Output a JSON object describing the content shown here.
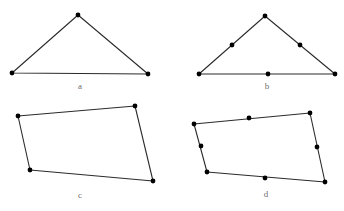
{
  "figure": {
    "width": 344,
    "height": 211,
    "background_color": "#ffffff",
    "line_color": "#2b2b2b",
    "vertex_color": "#000000",
    "label_color": "#6f6f6f",
    "line_width": 1.1,
    "vertex_radius": 2.4
  },
  "panels": [
    {
      "id": "a",
      "label": "a",
      "shape_type": "triangle",
      "label_position": {
        "x": 80,
        "y": 87
      },
      "vertices": [
        {
          "name": "left-base-vertex",
          "x": 12,
          "y": 73
        },
        {
          "name": "apex-vertex",
          "x": 78,
          "y": 15
        },
        {
          "name": "right-base-vertex",
          "x": 148,
          "y": 74
        }
      ],
      "edge_midpoints": []
    },
    {
      "id": "b",
      "label": "b",
      "shape_type": "triangle",
      "label_position": {
        "x": 267,
        "y": 87
      },
      "vertices": [
        {
          "name": "left-base-vertex",
          "x": 199,
          "y": 74
        },
        {
          "name": "apex-vertex",
          "x": 265,
          "y": 16
        },
        {
          "name": "right-base-vertex",
          "x": 335,
          "y": 74
        }
      ],
      "edge_midpoints": [
        {
          "name": "left-edge-midpoint",
          "x": 232,
          "y": 45
        },
        {
          "name": "right-edge-midpoint",
          "x": 300,
          "y": 45
        },
        {
          "name": "base-edge-midpoint",
          "x": 268,
          "y": 74
        }
      ]
    },
    {
      "id": "c",
      "label": "c",
      "shape_type": "quadrilateral",
      "label_position": {
        "x": 80,
        "y": 196
      },
      "vertices": [
        {
          "name": "top-left-vertex",
          "x": 18,
          "y": 116
        },
        {
          "name": "top-right-vertex",
          "x": 135,
          "y": 106
        },
        {
          "name": "bottom-right-vertex",
          "x": 153,
          "y": 181
        },
        {
          "name": "bottom-left-vertex",
          "x": 30,
          "y": 170
        }
      ],
      "edge_midpoints": []
    },
    {
      "id": "d",
      "label": "d",
      "shape_type": "quadrilateral",
      "label_position": {
        "x": 266,
        "y": 195
      },
      "vertices": [
        {
          "name": "top-left-vertex",
          "x": 194,
          "y": 124
        },
        {
          "name": "top-right-vertex",
          "x": 310,
          "y": 113
        },
        {
          "name": "bottom-right-vertex",
          "x": 325,
          "y": 182
        },
        {
          "name": "bottom-left-vertex",
          "x": 207,
          "y": 172
        }
      ],
      "edge_midpoints": [
        {
          "name": "top-edge-midpoint",
          "x": 249,
          "y": 118
        },
        {
          "name": "right-edge-midpoint",
          "x": 317,
          "y": 147
        },
        {
          "name": "bottom-edge-midpoint",
          "x": 265,
          "y": 178
        },
        {
          "name": "left-edge-midpoint",
          "x": 201,
          "y": 146
        }
      ]
    }
  ]
}
